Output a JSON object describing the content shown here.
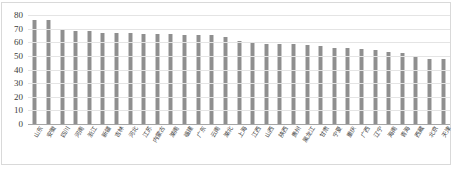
{
  "chart_data": {
    "type": "bar",
    "title": "",
    "subtitle": "",
    "xlabel": "",
    "ylabel": "",
    "ylim": [
      0,
      80
    ],
    "yticks": [
      0,
      10,
      20,
      30,
      40,
      50,
      60,
      70,
      80
    ],
    "grid": true,
    "legend": false,
    "legend_position": "none",
    "orientation": "vertical",
    "bar_color": "#8f8f8f",
    "gridline_color": "#e4e4e4",
    "axis_color": "#a6a6a6",
    "categories": [
      "山东",
      "安徽",
      "四川",
      "河南",
      "浙江",
      "新疆",
      "吉林",
      "河北",
      "江苏",
      "内蒙古",
      "湖南",
      "福建",
      "广东",
      "云南",
      "湖北",
      "上海",
      "江西",
      "山西",
      "陕西",
      "贵州",
      "黑龙江",
      "甘肃",
      "宁夏",
      "重庆",
      "广西",
      "辽宁",
      "海南",
      "青海",
      "西藏",
      "北京",
      "天津"
    ],
    "values": [
      76,
      76,
      69,
      68,
      68,
      67,
      67,
      67,
      66,
      66,
      66,
      65,
      65,
      65,
      64,
      61,
      60,
      59,
      59,
      59,
      58,
      57,
      56,
      56,
      55,
      54,
      53,
      52,
      50,
      48,
      48
    ]
  }
}
